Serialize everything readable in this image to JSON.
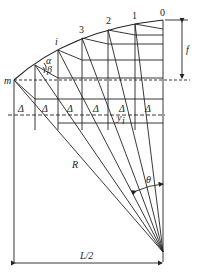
{
  "diagram": {
    "node_labels": [
      "0",
      "1",
      "2",
      "3",
      "i",
      "m"
    ],
    "labels": {
      "f": "f",
      "alpha": "α",
      "beta": "β",
      "delta": "Δ",
      "y_i": "y",
      "y_sub": "i",
      "R": "R",
      "theta": "θ",
      "half_span": "L/2"
    },
    "delta_count": 6,
    "stroke_color": "#222222"
  }
}
